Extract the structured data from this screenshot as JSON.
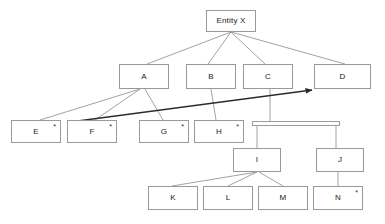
{
  "diagram": {
    "type": "entity-hierarchy-tree",
    "root": {
      "id": "entity-x",
      "label": "Entity X"
    },
    "nodes": [
      {
        "id": "entity-x",
        "label": "Entity X",
        "marker": "",
        "x": 206,
        "y": 10,
        "w": 50,
        "h": 22
      },
      {
        "id": "a",
        "label": "A",
        "marker": "",
        "x": 119,
        "y": 64,
        "w": 50,
        "h": 25
      },
      {
        "id": "b",
        "label": "B",
        "marker": "",
        "x": 186,
        "y": 64,
        "w": 50,
        "h": 25
      },
      {
        "id": "c",
        "label": "C",
        "marker": "",
        "x": 243,
        "y": 64,
        "w": 50,
        "h": 25
      },
      {
        "id": "d",
        "label": "D",
        "marker": "",
        "x": 314,
        "y": 64,
        "w": 57,
        "h": 25
      },
      {
        "id": "e",
        "label": "E",
        "marker": "*",
        "x": 11,
        "y": 120,
        "w": 50,
        "h": 23
      },
      {
        "id": "f",
        "label": "F",
        "marker": "*",
        "x": 67,
        "y": 120,
        "w": 50,
        "h": 23
      },
      {
        "id": "g",
        "label": "G",
        "marker": "*",
        "x": 139,
        "y": 120,
        "w": 50,
        "h": 23
      },
      {
        "id": "h",
        "label": "H",
        "marker": "*",
        "x": 194,
        "y": 120,
        "w": 50,
        "h": 23
      },
      {
        "id": "i",
        "label": "I",
        "marker": "",
        "x": 233,
        "y": 148,
        "w": 48,
        "h": 24
      },
      {
        "id": "j",
        "label": "J",
        "marker": "",
        "x": 316,
        "y": 148,
        "w": 48,
        "h": 24
      },
      {
        "id": "k",
        "label": "K",
        "marker": "",
        "x": 148,
        "y": 186,
        "w": 50,
        "h": 24
      },
      {
        "id": "l",
        "label": "L",
        "marker": "",
        "x": 203,
        "y": 186,
        "w": 50,
        "h": 24
      },
      {
        "id": "m",
        "label": "M",
        "marker": "",
        "x": 258,
        "y": 186,
        "w": 50,
        "h": 24
      },
      {
        "id": "n",
        "label": "N",
        "marker": "*",
        "x": 313,
        "y": 186,
        "w": 50,
        "h": 24
      }
    ],
    "connector_bar": {
      "id": "c-children-bar",
      "x": 252,
      "y": 121,
      "w": 88,
      "h": 5
    },
    "edges": [
      {
        "from": "entity-x",
        "to": "a",
        "x1": 231,
        "y1": 32,
        "x2": 147,
        "y2": 64,
        "style": "thin"
      },
      {
        "from": "entity-x",
        "to": "b",
        "x1": 231,
        "y1": 32,
        "x2": 208,
        "y2": 64,
        "style": "thin"
      },
      {
        "from": "entity-x",
        "to": "c",
        "x1": 231,
        "y1": 32,
        "x2": 265,
        "y2": 64,
        "style": "thin"
      },
      {
        "from": "entity-x",
        "to": "d",
        "x1": 231,
        "y1": 32,
        "x2": 345,
        "y2": 64,
        "style": "thin"
      },
      {
        "from": "a",
        "to": "e",
        "x1": 140,
        "y1": 89,
        "x2": 40,
        "y2": 120,
        "style": "thin"
      },
      {
        "from": "a",
        "to": "f",
        "x1": 140,
        "y1": 89,
        "x2": 95,
        "y2": 120,
        "style": "thin"
      },
      {
        "from": "a",
        "to": "g",
        "x1": 145,
        "y1": 89,
        "x2": 163,
        "y2": 120,
        "style": "thin"
      },
      {
        "from": "b",
        "to": "h",
        "x1": 211,
        "y1": 89,
        "x2": 216,
        "y2": 120,
        "style": "thin"
      },
      {
        "from": "c",
        "to": "connector-bar",
        "x1": 270,
        "y1": 89,
        "x2": 270,
        "y2": 121,
        "style": "thin"
      },
      {
        "from": "connector-bar",
        "to": "i",
        "x1": 257,
        "y1": 126,
        "x2": 257,
        "y2": 148,
        "style": "thin"
      },
      {
        "from": "connector-bar",
        "to": "j",
        "x1": 336,
        "y1": 126,
        "x2": 336,
        "y2": 148,
        "style": "thin"
      },
      {
        "from": "i",
        "to": "k",
        "x1": 257,
        "y1": 172,
        "x2": 172,
        "y2": 186,
        "style": "thin"
      },
      {
        "from": "i",
        "to": "l",
        "x1": 257,
        "y1": 172,
        "x2": 228,
        "y2": 186,
        "style": "thin"
      },
      {
        "from": "i",
        "to": "m",
        "x1": 259,
        "y1": 172,
        "x2": 283,
        "y2": 186,
        "style": "thin"
      },
      {
        "from": "j",
        "to": "n",
        "x1": 338,
        "y1": 172,
        "x2": 338,
        "y2": 186,
        "style": "thin"
      },
      {
        "from": "f",
        "to": "d",
        "x1": 70,
        "y1": 122,
        "x2": 312,
        "y2": 90,
        "style": "thick-arrow"
      }
    ],
    "colors": {
      "node_border": "#9a9a9a",
      "node_fill": "#ffffff",
      "edge_thin": "#8a8a8a",
      "edge_thick": "#2b2b2b",
      "label_text": "#1a1a1a",
      "background": "#ffffff"
    }
  },
  "caption": {
    "text": ""
  }
}
